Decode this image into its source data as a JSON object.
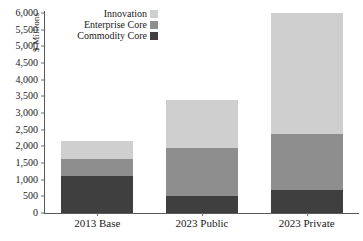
{
  "chart_data": {
    "type": "bar",
    "subtype": "stacked-vertical",
    "title": "",
    "xlabel": "",
    "ylabel": "$ Millions",
    "ylim": [
      0,
      6000
    ],
    "ytick_step": 500,
    "ytick_labels": [
      "6,000",
      "5,500",
      "5,000",
      "4,500",
      "4,000",
      "3,500",
      "3,000",
      "2,500",
      "2,000",
      "1,500",
      "1,000",
      "500",
      "0"
    ],
    "ytick_values": [
      6000,
      5500,
      5000,
      4500,
      4000,
      3500,
      3000,
      2500,
      2000,
      1500,
      1000,
      500,
      0
    ],
    "grid": false,
    "legend_position": "top-left-inside",
    "categories": [
      "2013 Base",
      "2023 Public",
      "2023 Private"
    ],
    "series": [
      {
        "name": "Commodity Core",
        "color": "#3f3f3f",
        "values": [
          1100,
          510,
          690
        ]
      },
      {
        "name": "Enterprise Core",
        "color": "#8e8e8e",
        "values": [
          520,
          1440,
          1680
        ]
      },
      {
        "name": "Innovation",
        "color": "#cfcfcf",
        "values": [
          530,
          1450,
          3630
        ]
      }
    ],
    "totals": [
      2150,
      3400,
      6000
    ],
    "legend_order": [
      "Innovation",
      "Enterprise Core",
      "Commodity Core"
    ]
  },
  "axis": {
    "y_title": "$ Millions"
  },
  "legend": {
    "items": [
      {
        "label": "Innovation",
        "color": "#cfcfcf"
      },
      {
        "label": "Enterprise Core",
        "color": "#8e8e8e"
      },
      {
        "label": "Commodity Core",
        "color": "#3f3f3f"
      }
    ]
  }
}
